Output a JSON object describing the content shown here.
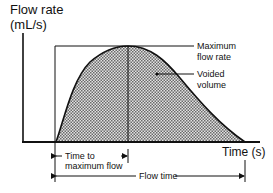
{
  "diagram": {
    "y_axis": {
      "title": "Flow rate",
      "unit": "(mL/s)"
    },
    "x_axis": {
      "title": "Time (s)"
    },
    "annotations": {
      "max_flow_line1": "Maximum",
      "max_flow_line2": "flow rate",
      "voided_line1": "Voided",
      "voided_line2": "volume",
      "time_to_max_line1": "Time to",
      "time_to_max_line2": "maximum flow",
      "flow_time": "Flow time"
    },
    "colors": {
      "line": "#111111",
      "fill": "#b5b5b5",
      "background": "#ffffff"
    }
  }
}
